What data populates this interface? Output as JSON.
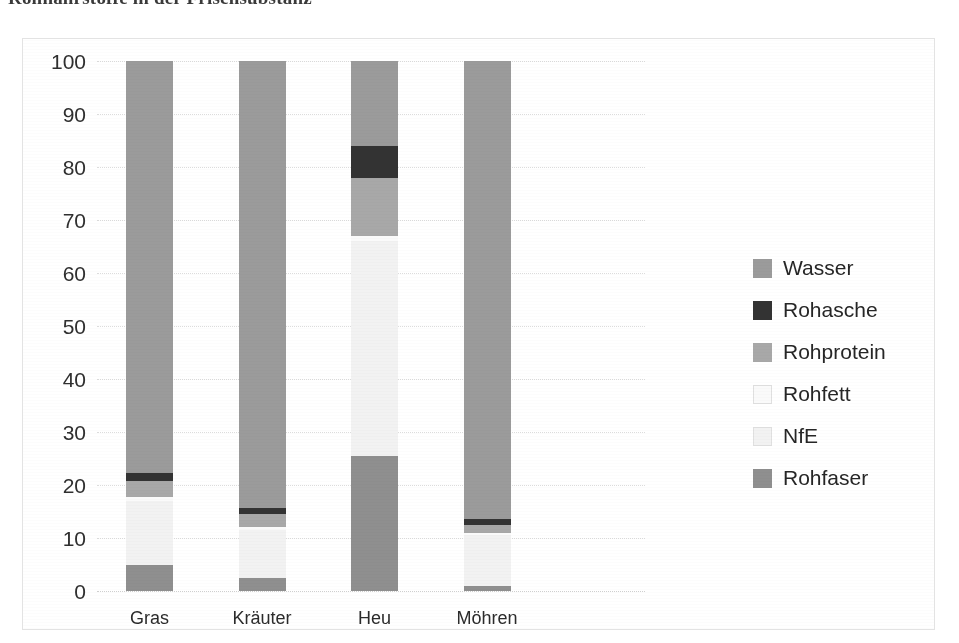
{
  "document": {
    "heading": "Rohnährstoffe in der Frischsubstanz"
  },
  "chart_data": {
    "type": "bar",
    "stacked": true,
    "stack_mode": "percent",
    "title": "",
    "subtitle": "",
    "xlabel": "",
    "ylabel": "",
    "ylim": [
      0,
      100
    ],
    "yticks": [
      0,
      10,
      20,
      30,
      40,
      50,
      60,
      70,
      80,
      90,
      100
    ],
    "ytick_labels": [
      "0",
      "10",
      "20",
      "30",
      "40",
      "50",
      "60",
      "70",
      "80",
      "90",
      "100"
    ],
    "grid": true,
    "grid_axis": "y",
    "legend_position": "right",
    "categories": [
      "Gras",
      "Kräuter",
      "Heu",
      "Möhren"
    ],
    "series": [
      {
        "name": "Rohfaser",
        "color": "#8f8f8f",
        "values": [
          5.0,
          2.5,
          25.5,
          1.0
        ]
      },
      {
        "name": "NfE",
        "color": "#f2f2f2",
        "values": [
          12.0,
          9.0,
          40.5,
          9.5
        ]
      },
      {
        "name": "Rohfett",
        "color": "#fafafa",
        "values": [
          0.8,
          0.6,
          1.0,
          0.4
        ]
      },
      {
        "name": "Rohprotein",
        "color": "#a8a8a8",
        "values": [
          3.0,
          2.4,
          11.0,
          1.5
        ]
      },
      {
        "name": "Rohasche",
        "color": "#333333",
        "values": [
          1.5,
          1.2,
          6.0,
          1.1
        ]
      },
      {
        "name": "Wasser",
        "color": "#9b9b9b",
        "values": [
          77.7,
          84.3,
          16.0,
          86.5
        ]
      }
    ],
    "legend_order": [
      "Wasser",
      "Rohasche",
      "Rohprotein",
      "Rohfett",
      "NfE",
      "Rohfaser"
    ],
    "colors": {
      "wasser": "#9b9b9b",
      "rohasche": "#333333",
      "rohprotein": "#a8a8a8",
      "rohfett": "#fafafa",
      "nfe": "#f2f2f2",
      "rohfaser": "#8f8f8f"
    },
    "plot_background": "#ffffff",
    "gridline_color": "#dcdcdc",
    "border_color": "#e3e3e3"
  }
}
